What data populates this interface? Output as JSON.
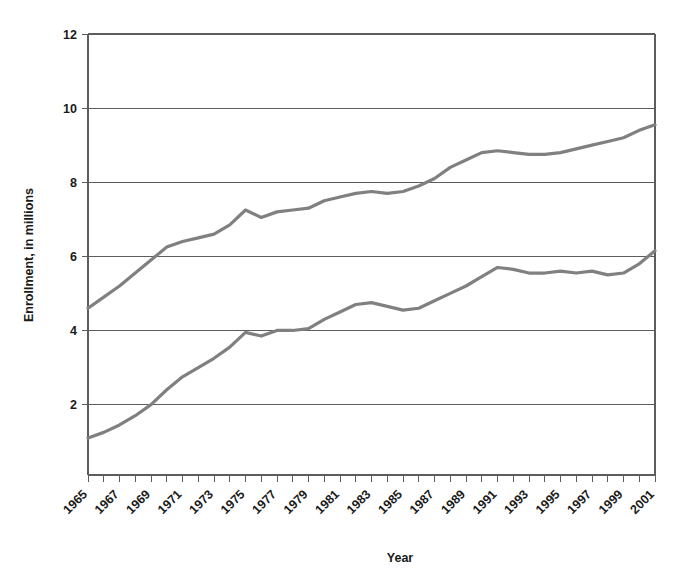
{
  "chart_data": {
    "type": "line",
    "title": "",
    "xlabel": "Year",
    "ylabel": "Enrollment, in millions",
    "grid": true,
    "legend": "none",
    "xlim": [
      1965,
      2001
    ],
    "ylim": [
      0.1,
      12
    ],
    "yticks": [
      2,
      4,
      6,
      8,
      10,
      12
    ],
    "ytick_labels": [
      "2",
      "4",
      "6",
      "8",
      "10",
      "12"
    ],
    "x": [
      1965,
      1966,
      1967,
      1968,
      1969,
      1970,
      1971,
      1972,
      1973,
      1974,
      1975,
      1976,
      1977,
      1978,
      1979,
      1980,
      1981,
      1982,
      1983,
      1984,
      1985,
      1986,
      1987,
      1988,
      1989,
      1990,
      1991,
      1992,
      1993,
      1994,
      1995,
      1996,
      1997,
      1998,
      1999,
      2000,
      2001
    ],
    "xtick_labels": [
      "1965",
      "1967",
      "1969",
      "1971",
      "1973",
      "1975",
      "1977",
      "1979",
      "1981",
      "1983",
      "1985",
      "1987",
      "1989",
      "1991",
      "1993",
      "1995",
      "1997",
      "1999",
      "2001"
    ],
    "series": [
      {
        "name": "upper-series",
        "color": "#808080",
        "values": [
          4.6,
          4.9,
          5.2,
          5.55,
          5.9,
          6.25,
          6.4,
          6.5,
          6.6,
          6.85,
          7.25,
          7.05,
          7.2,
          7.25,
          7.3,
          7.5,
          7.6,
          7.7,
          7.75,
          7.7,
          7.75,
          7.9,
          8.1,
          8.4,
          8.6,
          8.8,
          8.85,
          8.8,
          8.75,
          8.75,
          8.8,
          8.9,
          9.0,
          9.1,
          9.2,
          9.4,
          9.55
        ]
      },
      {
        "name": "lower-series",
        "color": "#808080",
        "values": [
          1.1,
          1.25,
          1.45,
          1.7,
          2.0,
          2.4,
          2.75,
          3.0,
          3.25,
          3.55,
          3.95,
          3.85,
          4.0,
          4.0,
          4.05,
          4.3,
          4.5,
          4.7,
          4.75,
          4.65,
          4.55,
          4.6,
          4.8,
          5.0,
          5.2,
          5.45,
          5.7,
          5.65,
          5.55,
          5.55,
          5.6,
          5.55,
          5.6,
          5.5,
          5.55,
          5.8,
          6.15
        ]
      }
    ]
  },
  "axes": {
    "y_axis_title": "Enrollment, in millions",
    "x_axis_title": "Year"
  }
}
